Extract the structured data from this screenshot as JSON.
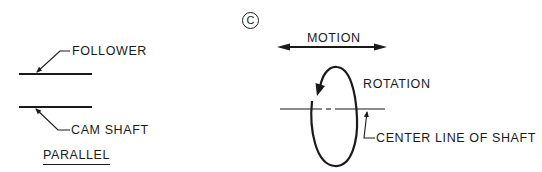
{
  "figure": {
    "label": "C",
    "stroke_color": "#1a1a1a",
    "background": "#ffffff"
  },
  "parallel_diagram": {
    "title": "PARALLEL",
    "follower_label": "FOLLOWER",
    "cam_shaft_label": "CAM SHAFT"
  },
  "motion_diagram": {
    "motion_label": "MOTION",
    "rotation_label": "ROTATION",
    "center_line_label": "CENTER LINE OF SHAFT"
  }
}
